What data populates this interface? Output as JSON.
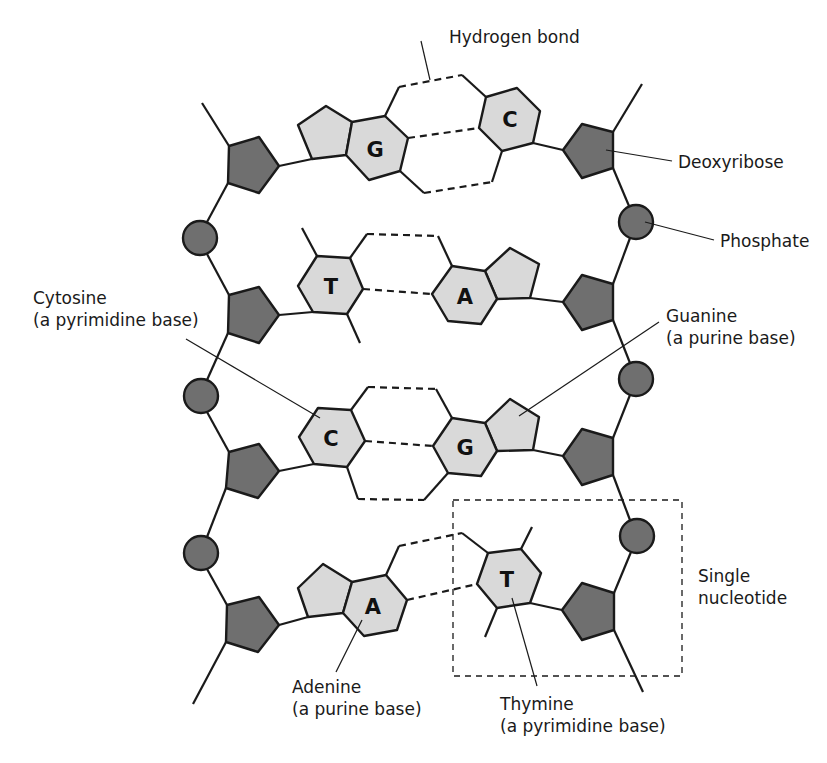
{
  "diagram": {
    "type": "DNA double helix segment",
    "base_pairs": [
      {
        "left": "G",
        "right": "C",
        "hydrogen_bonds": 3
      },
      {
        "left": "T",
        "right": "A",
        "hydrogen_bonds": 2
      },
      {
        "left": "C",
        "right": "G",
        "hydrogen_bonds": 3
      },
      {
        "left": "A",
        "right": "T",
        "hydrogen_bonds": 2
      }
    ],
    "labels": {
      "hydrogen_bond": "Hydrogen bond",
      "deoxyribose": "Deoxyribose",
      "phosphate": "Phosphate",
      "cytosine_name": "Cytosine",
      "cytosine_desc": "(a pyrimidine base)",
      "guanine_name": "Guanine",
      "guanine_desc": "(a purine base)",
      "single_nucleotide_1": "Single",
      "single_nucleotide_2": "nucleotide",
      "adenine_name": "Adenine",
      "adenine_desc": "(a purine base)",
      "thymine_name": "Thymine",
      "thymine_desc": "(a pyrimidine base)"
    },
    "colors": {
      "sugar_phosphate": "#6f6f6f",
      "base": "#d9d9d9",
      "outline": "#1a1a1a"
    }
  }
}
